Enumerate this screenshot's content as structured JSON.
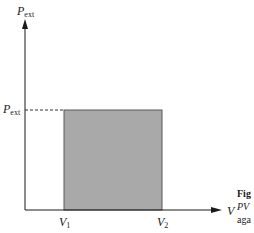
{
  "diagram": {
    "type": "PV diagram",
    "y_axis": {
      "symbol": "P",
      "subscript": "ext"
    },
    "x_axis": {
      "symbol": "V"
    },
    "y_tick": {
      "symbol": "P",
      "subscript": "ext"
    },
    "x_ticks": [
      {
        "symbol": "V",
        "subscript": "1"
      },
      {
        "symbol": "V",
        "subscript": "2"
      }
    ],
    "shaded_region": {
      "fill": "#a9a9a9",
      "from": "V1",
      "to": "V2",
      "height": "Pext"
    },
    "colors": {
      "axis": "#1a1a1a",
      "shade": "#a9a9a9",
      "border": "#555555"
    }
  },
  "caption": {
    "line1": "Fig",
    "line2": "PV",
    "line3": "aga"
  }
}
